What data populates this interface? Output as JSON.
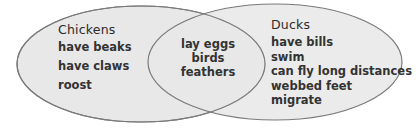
{
  "diagram": {
    "type": "venn",
    "colors": {
      "fill": "#e8e8e8",
      "stroke": "#7a7a7a",
      "background": "#ffffff",
      "text": "#2b2b2b"
    },
    "sets": [
      {
        "title": "Chickens",
        "items": [
          "have beaks",
          "have claws",
          "roost"
        ]
      },
      {
        "title": "Ducks",
        "items": [
          "have bills",
          "swim",
          "can fly long distances",
          "webbed feet",
          "migrate"
        ]
      }
    ],
    "intersection": {
      "items": [
        "lay eggs",
        "birds",
        "feathers"
      ]
    }
  }
}
